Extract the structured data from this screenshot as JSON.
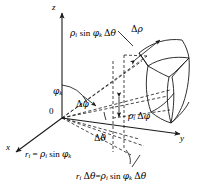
{
  "figure": {
    "background_color": "#ffffff",
    "line_color": "#1a1a1a",
    "axes": {
      "z_label": "z",
      "y_label": "y",
      "x_label": "x"
    },
    "origin_label": "0",
    "labels": {
      "rho_sin_phi_delta_theta": "ρᵢ sin φₖ Δθ",
      "delta_rho": "Δρ",
      "phi_k": "φₖ",
      "delta_phi": "Δφ",
      "rho_delta_phi": "ρᵢ Δφ",
      "delta_theta": "Δθ",
      "r_equals": "rᵢ = ρᵢ sin φₖ",
      "r_delta_theta_equals": "rᵢ Δθ = ρᵢ sin φₖ Δθ"
    },
    "label_parts": {
      "rho_sin_phi_delta_theta": {
        "rho": "ρ",
        "i": "i",
        "sin": "sin",
        "phi": "φ",
        "k": "k",
        "delta": "Δ",
        "theta": "θ"
      },
      "delta_rho": {
        "delta": "Δ",
        "rho": "ρ"
      },
      "phi_k": {
        "phi": "φ",
        "k": "k"
      },
      "delta_phi": {
        "delta": "Δ",
        "phi": "φ"
      },
      "rho_delta_phi": {
        "rho": "ρ",
        "i": "i",
        "delta": "Δ",
        "phi": "φ"
      },
      "delta_theta": {
        "delta": "Δ",
        "theta": "θ"
      },
      "r_equals": {
        "r": "r",
        "i": "i",
        "eq": "=",
        "rho": "ρ",
        "sin": "sin",
        "phi": "φ",
        "k": "k"
      },
      "r_delta_theta_equals": {
        "r": "r",
        "i": "i",
        "delta": "Δ",
        "theta": "θ",
        "eq": "=",
        "rho": "ρ",
        "sin": "sin",
        "phi": "φ",
        "k": "k"
      }
    }
  }
}
